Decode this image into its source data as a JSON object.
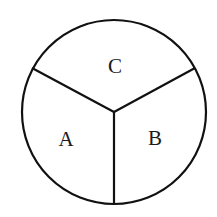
{
  "diagram": {
    "type": "circle divided into three sectors",
    "sectors": [
      {
        "label": "A",
        "position": "lower-left"
      },
      {
        "label": "B",
        "position": "lower-right"
      },
      {
        "label": "C",
        "position": "top"
      }
    ],
    "colors": {
      "stroke": "#111111",
      "background": "#ffffff"
    }
  }
}
